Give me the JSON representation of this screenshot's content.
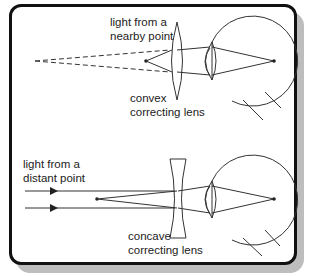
{
  "top_panel": {
    "source_label_line1": "light from a",
    "source_label_line2": "nearby point",
    "lens_label_line1": "convex",
    "lens_label_line2": "correcting lens"
  },
  "bottom_panel": {
    "source_label_line1": "light from a",
    "source_label_line2": "distant point",
    "lens_label_line1": "concave",
    "lens_label_line2": "correcting lens"
  },
  "colors": {
    "line": "#333333",
    "frame": "#111111",
    "shadow": "#bdbdbd"
  }
}
